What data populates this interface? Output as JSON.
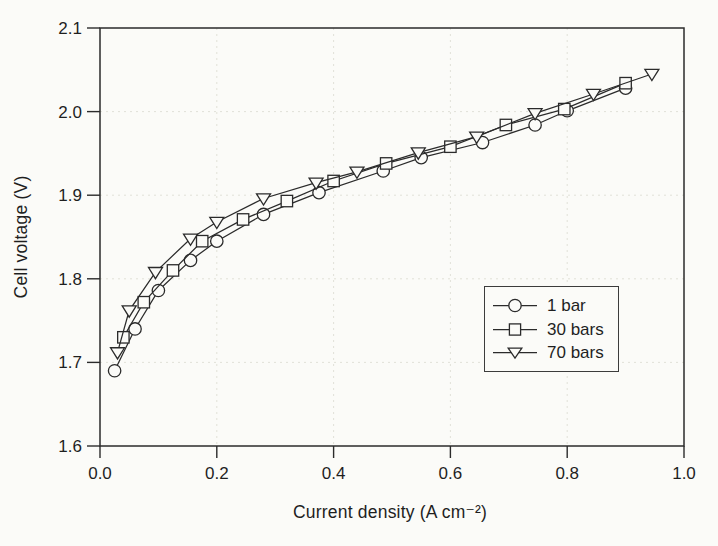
{
  "figure": {
    "background": "#fbfbf8",
    "ink": "#2b2b2b",
    "grid_color": "#e1e1d8",
    "text_color": "#1f1f1f"
  },
  "chart_data": {
    "type": "line",
    "title": "",
    "xlabel": "Current density (A cm⁻²)",
    "ylabel": "Cell voltage (V)",
    "xlim": [
      0.0,
      1.0
    ],
    "ylim": [
      1.6,
      2.1
    ],
    "grid": "faint dotted gridlines at interior major ticks",
    "legend_position": "inside-right framed box",
    "x_ticks": [
      {
        "value": 0.0,
        "label": "0.0"
      },
      {
        "value": 0.2,
        "label": "0.2"
      },
      {
        "value": 0.4,
        "label": "0.4"
      },
      {
        "value": 0.6,
        "label": "0.6"
      },
      {
        "value": 0.8,
        "label": "0.8"
      },
      {
        "value": 1.0,
        "label": "1.0"
      }
    ],
    "y_ticks": [
      {
        "value": 1.6,
        "label": "1.6"
      },
      {
        "value": 1.7,
        "label": "1.7"
      },
      {
        "value": 1.8,
        "label": "1.8"
      },
      {
        "value": 1.9,
        "label": "1.9"
      },
      {
        "value": 2.0,
        "label": "2.0"
      },
      {
        "value": 2.1,
        "label": "2.1"
      }
    ],
    "series": [
      {
        "name": "1 bar",
        "marker": "circle",
        "points": [
          [
            0.025,
            1.69
          ],
          [
            0.06,
            1.74
          ],
          [
            0.1,
            1.786
          ],
          [
            0.155,
            1.822
          ],
          [
            0.2,
            1.845
          ],
          [
            0.28,
            1.877
          ],
          [
            0.375,
            1.903
          ],
          [
            0.485,
            1.929
          ],
          [
            0.55,
            1.945
          ],
          [
            0.655,
            1.963
          ],
          [
            0.745,
            1.984
          ],
          [
            0.8,
            2.001
          ],
          [
            0.9,
            2.028
          ]
        ]
      },
      {
        "name": "30 bars",
        "marker": "square",
        "points": [
          [
            0.04,
            1.73
          ],
          [
            0.075,
            1.772
          ],
          [
            0.125,
            1.81
          ],
          [
            0.175,
            1.845
          ],
          [
            0.245,
            1.871
          ],
          [
            0.32,
            1.893
          ],
          [
            0.4,
            1.917
          ],
          [
            0.49,
            1.938
          ],
          [
            0.6,
            1.958
          ],
          [
            0.695,
            1.984
          ],
          [
            0.795,
            2.003
          ],
          [
            0.9,
            2.034
          ]
        ]
      },
      {
        "name": "70 bars",
        "marker": "triangle-down",
        "points": [
          [
            0.03,
            1.712
          ],
          [
            0.05,
            1.762
          ],
          [
            0.095,
            1.808
          ],
          [
            0.155,
            1.848
          ],
          [
            0.2,
            1.868
          ],
          [
            0.28,
            1.896
          ],
          [
            0.37,
            1.915
          ],
          [
            0.44,
            1.928
          ],
          [
            0.545,
            1.951
          ],
          [
            0.645,
            1.97
          ],
          [
            0.745,
            1.998
          ],
          [
            0.845,
            2.021
          ],
          [
            0.945,
            2.045
          ]
        ]
      }
    ]
  }
}
